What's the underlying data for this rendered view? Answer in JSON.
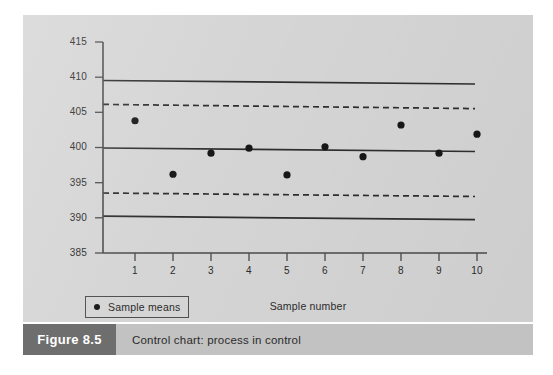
{
  "figure": {
    "caption_number": "Figure 8.5",
    "caption_text": "Control chart: process in control",
    "panel_color": "#d5d5d5",
    "caption_bar_color": "#c2c2c2",
    "caption_number_block_color": "#6e6e6e",
    "ink_color": "#2e2e2e"
  },
  "legend": {
    "marker_icon": "filled-circle-icon",
    "label": "Sample means"
  },
  "chart_data": {
    "type": "scatter",
    "title": "Control chart: process in control",
    "xlabel": "Sample number",
    "ylabel": "",
    "x": [
      1,
      2,
      3,
      4,
      5,
      6,
      7,
      8,
      9,
      10
    ],
    "categories": [
      "1",
      "2",
      "3",
      "4",
      "5",
      "6",
      "7",
      "8",
      "9",
      "10"
    ],
    "values": [
      403.8,
      396.2,
      399.2,
      399.9,
      396.1,
      400.1,
      398.7,
      403.2,
      399.2,
      401.9
    ],
    "series": [
      {
        "name": "Sample means",
        "values": [
          403.8,
          396.2,
          399.2,
          399.9,
          396.1,
          400.1,
          398.7,
          403.2,
          399.2,
          401.9
        ]
      }
    ],
    "xlim": [
      0.45,
      10.45
    ],
    "ylim": [
      385,
      415
    ],
    "ytick_labels": [
      "415",
      "410",
      "405",
      "400",
      "395",
      "390",
      "385"
    ],
    "yticks": [
      415,
      410,
      405,
      400,
      395,
      390,
      385
    ],
    "xtick_labels": [
      "1",
      "2",
      "3",
      "4",
      "5",
      "6",
      "7",
      "8",
      "9",
      "10"
    ],
    "grid": false,
    "legend_position": "bottom-left",
    "reference_lines": [
      {
        "name": "upper-action-limit",
        "style": "solid",
        "y_left": 409.6,
        "y_right": 409.1
      },
      {
        "name": "upper-warning-limit",
        "style": "dashed",
        "y_left": 406.2,
        "y_right": 405.6
      },
      {
        "name": "centre-line",
        "style": "solid",
        "y_left": 400.0,
        "y_right": 399.5
      },
      {
        "name": "lower-warning-limit",
        "style": "dashed",
        "y_left": 393.6,
        "y_right": 393.1
      },
      {
        "name": "lower-action-limit",
        "style": "solid",
        "y_left": 390.3,
        "y_right": 389.8
      }
    ]
  }
}
